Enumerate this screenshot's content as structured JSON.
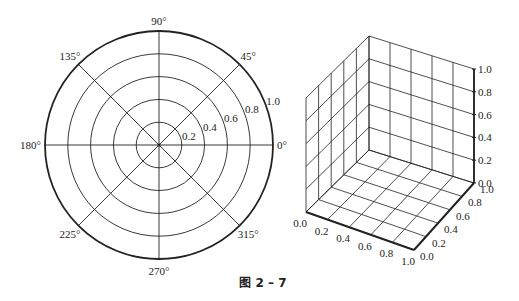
{
  "caption": "图 2 – 7",
  "colors": {
    "line": "#222222",
    "background": "#ffffff"
  },
  "chart_data": [
    {
      "type": "polar",
      "title": "",
      "angle_ticks": [
        "0°",
        "45°",
        "90°",
        "135°",
        "180°",
        "225°",
        "270°",
        "315°"
      ],
      "angles": [
        0,
        45,
        90,
        135,
        180,
        225,
        270,
        315
      ],
      "radial_ticks": [
        "0.2",
        "0.4",
        "0.6",
        "0.8",
        "1.0"
      ],
      "radial_values": [
        0.2,
        0.4,
        0.6,
        0.8,
        1.0
      ],
      "rlim": [
        0,
        1.0
      ],
      "grid": true,
      "series": []
    },
    {
      "type": "3d-axes",
      "title": "",
      "x_ticks": [
        "0.0",
        "0.2",
        "0.4",
        "0.6",
        "0.8",
        "1.0"
      ],
      "y_ticks": [
        "0.0",
        "0.2",
        "0.4",
        "0.6",
        "0.8",
        "1.0"
      ],
      "z_ticks": [
        "0.0",
        "0.2",
        "0.4",
        "0.6",
        "0.8",
        "1.0"
      ],
      "xlim": [
        0,
        1
      ],
      "ylim": [
        0,
        1
      ],
      "zlim": [
        0,
        1
      ],
      "grid": true,
      "series": []
    }
  ]
}
